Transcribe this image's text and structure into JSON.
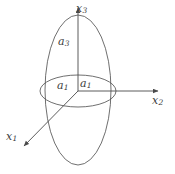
{
  "figure": {
    "description_kind": "3d-ellipsoid-axes-diagram",
    "stroke_color": "#4a4a4a",
    "text_color": "#3b3b3b",
    "background_color": "#ffffff",
    "axes": [
      {
        "name": "x1",
        "label": "x",
        "sub": "1",
        "direction": "down-left"
      },
      {
        "name": "x2",
        "label": "x",
        "sub": "2",
        "direction": "right"
      },
      {
        "name": "x3",
        "label": "x",
        "sub": "3",
        "direction": "up"
      }
    ],
    "dimensions": [
      {
        "name": "a3",
        "label": "a",
        "sub": "3",
        "note": "semi-axis along x3"
      },
      {
        "name": "a1-left",
        "label": "a",
        "sub": "1",
        "note": "semi-axis toward x1"
      },
      {
        "name": "a1-right",
        "label": "a",
        "sub": "1",
        "note": "semi-axis toward x2"
      }
    ],
    "shapes": [
      {
        "name": "meridian-ellipse",
        "type": "ellipse",
        "cx": 78,
        "cy": 90,
        "rx": 33,
        "ry": 75
      },
      {
        "name": "equatorial-ellipse",
        "type": "ellipse",
        "cx": 78,
        "cy": 91,
        "rx": 38,
        "ry": 16
      }
    ]
  }
}
